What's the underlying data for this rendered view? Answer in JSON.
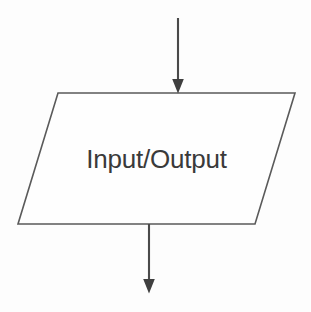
{
  "diagram": {
    "type": "flowchart",
    "background_color": "#fdfdfd",
    "stroke_color": "#5a5a5a",
    "arrow_color": "#3f3f3f",
    "text_color": "#3a3a3a",
    "nodes": [
      {
        "id": "io-node",
        "shape": "parallelogram",
        "label": "Input/Output",
        "semantic": "input-output",
        "top_left_x": 58,
        "top_right_x": 295,
        "bottom_left_x": 18,
        "bottom_right_x": 255,
        "top_y": 93,
        "bottom_y": 224,
        "fill": "#fefefe",
        "stroke": "#5a5a5a"
      }
    ],
    "connectors": [
      {
        "id": "incoming-arrow",
        "label": "",
        "direction": "down",
        "x": 178,
        "from_y": 18,
        "to_y": 93,
        "arrowhead": "filled-triangle",
        "arrowhead_position": "end"
      },
      {
        "id": "outgoing-arrow",
        "label": "",
        "direction": "down",
        "x": 149,
        "from_y": 224,
        "to_y": 293,
        "arrowhead": "filled-triangle",
        "arrowhead_position": "end"
      }
    ]
  }
}
